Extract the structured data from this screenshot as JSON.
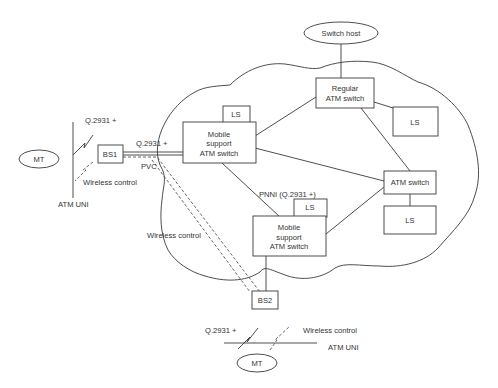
{
  "diagram": {
    "nodes": {
      "switch_host": "Switch host",
      "regular_switch": [
        "Regular",
        "ATM switch"
      ],
      "ls_regular": "LS",
      "mobile_switch_1": [
        "Mobile",
        "support",
        "ATM switch"
      ],
      "ls_mobile_1": "LS",
      "atm_switch": "ATM switch",
      "ls_atm": "LS",
      "mobile_switch_2": [
        "Mobile",
        "support",
        "ATM switch"
      ],
      "ls_mobile_2": "LS",
      "bs1": "BS1",
      "bs2": "BS2",
      "mt_left": "MT",
      "mt_bottom": "MT"
    },
    "labels": {
      "q2931_left_uni": "Q.2931 +",
      "q2931_bs1_link": "Q.2931 +",
      "pvc": "PVC",
      "wireless_control_left": "Wireless control",
      "atm_uni_left": "ATM UNI",
      "pnni": "PNNI (Q.2931 +)",
      "wireless_control_mid": "Wireless control",
      "q2931_bottom": "Q.2931 +",
      "wireless_control_bottom": "Wireless control",
      "atm_uni_bottom": "ATM UNI"
    }
  }
}
